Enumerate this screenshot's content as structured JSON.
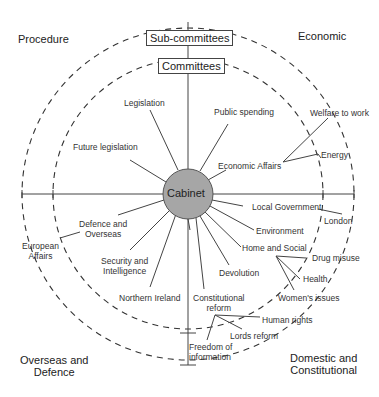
{
  "diagram": {
    "center": "Cabinet",
    "rings": {
      "inner": "Committees",
      "outer": "Sub-committees"
    },
    "quadrants": {
      "top_left": "Procedure",
      "top_right": "Economic",
      "bottom_left": [
        "Overseas and",
        "Defence"
      ],
      "bottom_right": [
        "Domestic and",
        "Constitutional"
      ]
    },
    "committees": {
      "legislation": "Legislation",
      "future_legislation": "Future legislation",
      "public_spending": "Public spending",
      "economic_affairs": "Economic Affairs",
      "local_government": "Local Government",
      "environment": "Environment",
      "home_and_social": "Home and Social",
      "devolution": "Devolution",
      "constitutional_reform": [
        "Constitutional",
        "reform"
      ],
      "northern_ireland": "Northern Ireland",
      "security_intelligence": [
        "Security and",
        "Intelligence"
      ],
      "defence_overseas": [
        "Defence and",
        "Overseas"
      ]
    },
    "sub_committees": {
      "welfare_to_work": "Welfare to work",
      "energy": "Energy",
      "london": "London",
      "drug_misuse": "Drug misuse",
      "health": "Health",
      "womens_issues": "Women's issues",
      "human_rights": "Human rights",
      "lords_reform": "Lords reform",
      "freedom_of_information": [
        "Freedom of",
        "information"
      ],
      "european_affairs": [
        "European",
        "Affairs"
      ]
    },
    "colors": {
      "cabinet_fill": "#a6a6a6",
      "lines": "#444444"
    }
  }
}
